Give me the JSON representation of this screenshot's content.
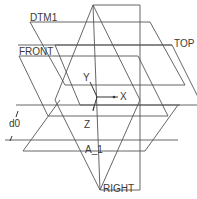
{
  "view": {
    "background": "#ffffff",
    "line_color": "#555555"
  },
  "datum_planes": [
    {
      "id": "dtm1",
      "label": "DTM1"
    },
    {
      "id": "front",
      "label": "FRONT"
    },
    {
      "id": "top",
      "label": "TOP"
    },
    {
      "id": "right",
      "label": "RIGHT"
    }
  ],
  "axis": {
    "label": "A_1"
  },
  "coordinate_system": {
    "x_label": "X",
    "y_label": "Y",
    "z_label": "Z"
  },
  "dimension": {
    "label": "d0"
  }
}
